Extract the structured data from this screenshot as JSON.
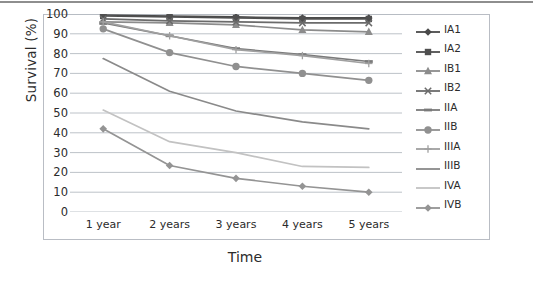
{
  "chart_data": {
    "type": "line",
    "title": "",
    "xlabel": "Time",
    "ylabel": "Survival (%)",
    "categories": [
      "1 year",
      "2 years",
      "3 years",
      "4 years",
      "5 years"
    ],
    "ylim": [
      0,
      100
    ],
    "ytick_labels": [
      "0",
      "10",
      "20",
      "30",
      "40",
      "50",
      "60",
      "70",
      "80",
      "90",
      "100"
    ],
    "ytick_values": [
      0,
      10,
      20,
      30,
      40,
      50,
      60,
      70,
      80,
      90,
      100
    ],
    "grid": true,
    "legend_position": "right",
    "series": [
      {
        "name": "IA1",
        "values": [
          99.5,
          99,
          98.5,
          98,
          98
        ],
        "color": "#4a4a4a",
        "marker": "diamond"
      },
      {
        "name": "IA2",
        "values": [
          99,
          98.5,
          98,
          97.5,
          97.5
        ],
        "color": "#4f4f4f",
        "marker": "square"
      },
      {
        "name": "IB1",
        "values": [
          96,
          95.5,
          94.5,
          92,
          91
        ],
        "color": "#8c8c8c",
        "marker": "triangle"
      },
      {
        "name": "IB2",
        "values": [
          97.5,
          96.5,
          96,
          95.5,
          95.5
        ],
        "color": "#6b6b6b",
        "marker": "x"
      },
      {
        "name": "IIA",
        "values": [
          95.5,
          89,
          82.5,
          79.5,
          76
        ],
        "color": "#7a7a7a",
        "marker": "dash"
      },
      {
        "name": "IIB",
        "values": [
          92.5,
          80.5,
          73.5,
          70,
          66.5
        ],
        "color": "#909090",
        "marker": "circle"
      },
      {
        "name": "IIIA",
        "values": [
          96,
          89,
          82,
          79,
          75
        ],
        "color": "#a0a0a0",
        "marker": "plus"
      },
      {
        "name": "IIIB",
        "values": [
          77.5,
          61,
          51,
          45.5,
          42
        ],
        "color": "#8a8a8a",
        "marker": "none"
      },
      {
        "name": "IVA",
        "values": [
          51.5,
          35.5,
          30,
          23,
          22.5
        ],
        "color": "#c2c2c2",
        "marker": "none"
      },
      {
        "name": "IVB",
        "values": [
          42,
          23.5,
          17,
          13,
          10
        ],
        "color": "#949494",
        "marker": "diamond"
      }
    ]
  },
  "axes": {
    "y_title": "Survival (%)",
    "x_title": "Time"
  }
}
